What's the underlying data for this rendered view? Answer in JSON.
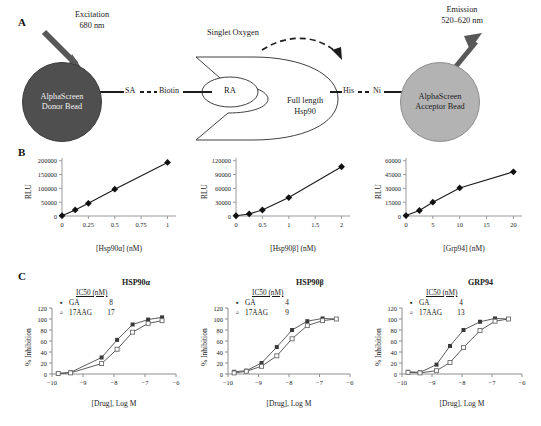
{
  "panels": {
    "a_letter": "A",
    "b_letter": "B",
    "c_letter": "C"
  },
  "diagram": {
    "excitation_label": "Excitation\n680 nm",
    "excitation_line1": "Excitation",
    "excitation_line2": "680 nm",
    "emission_line1": "Emission",
    "emission_line2": "520–620 nm",
    "singlet_oxygen": "Singlet Oxygen",
    "donor_line1": "AlphaScreen",
    "donor_line2": "Donor Bead",
    "acceptor_line1": "AlphaScreen",
    "acceptor_line2": "Acceptor Bead",
    "sa": "SA",
    "biotin": "Biotin",
    "his": "His",
    "ni": "Ni",
    "ra": "RA",
    "hsp90_line1": "Full length",
    "hsp90_line2": "Hsp90",
    "donor_color": "#4f4f4f",
    "acceptor_color": "#b3b3b3",
    "arrow_color": "#555555"
  },
  "chart_data": [
    {
      "id": "b1",
      "type": "line",
      "title": "",
      "xlabel": "[Hsp90α] (nM)",
      "ylabel": "RLU",
      "x": [
        0,
        0.125,
        0.25,
        0.5,
        1
      ],
      "values": [
        1000,
        22000,
        46000,
        97000,
        194000
      ],
      "xticks": [
        0,
        0.25,
        0.5,
        0.75,
        1
      ],
      "xticklabels": [
        "0",
        "0.25",
        "0.5",
        "0.75",
        "1"
      ],
      "yticks": [
        0,
        50000,
        100000,
        150000,
        200000
      ],
      "yticklabels": [
        "0",
        "50000",
        "100000",
        "150000",
        "200000"
      ],
      "xlim": [
        0,
        1.08
      ],
      "ylim": [
        0,
        210000
      ],
      "grid": false,
      "marker": "diamond"
    },
    {
      "id": "b2",
      "type": "line",
      "title": "",
      "xlabel": "[Hsp90β] (nM)",
      "ylabel": "RLU",
      "x": [
        0,
        0.25,
        0.5,
        1,
        2
      ],
      "values": [
        500,
        4500,
        13000,
        40000,
        107000
      ],
      "xticks": [
        0,
        0.5,
        1,
        1.5,
        2
      ],
      "xticklabels": [
        "0",
        "0.5",
        "1",
        "1.5",
        "2"
      ],
      "yticks": [
        0,
        30000,
        60000,
        90000,
        120000
      ],
      "yticklabels": [
        "0",
        "30000",
        "60000",
        "90000",
        "120000"
      ],
      "xlim": [
        0,
        2.16
      ],
      "ylim": [
        0,
        126000
      ],
      "grid": false,
      "marker": "diamond"
    },
    {
      "id": "b3",
      "type": "line",
      "title": "",
      "xlabel": "[Grp94] (nM)",
      "ylabel": "RLU",
      "x": [
        0,
        2.5,
        5,
        10,
        20
      ],
      "values": [
        500,
        6000,
        15000,
        30500,
        48000
      ],
      "xticks": [
        0,
        5,
        10,
        15,
        20
      ],
      "xticklabels": [
        "0",
        "5",
        "10",
        "15",
        "20"
      ],
      "yticks": [
        0,
        15000,
        30000,
        45000,
        60000
      ],
      "yticklabels": [
        "0",
        "15000",
        "30000",
        "45000",
        "60000"
      ],
      "xlim": [
        0,
        21.6
      ],
      "ylim": [
        0,
        63000
      ],
      "grid": false,
      "marker": "diamond"
    },
    {
      "id": "c1",
      "type": "line",
      "title": "HSP90α",
      "xlabel": "[Drug], Log M",
      "ylabel": "% Inhibition",
      "xticks": [
        -10,
        -9,
        -8,
        -7,
        -6
      ],
      "xticklabels": [
        "−10",
        "−9",
        "−8",
        "−7",
        "−6"
      ],
      "yticks": [
        0,
        20,
        40,
        60,
        80,
        100,
        120
      ],
      "yticklabels": [
        "0",
        "20",
        "40",
        "60",
        "80",
        "100",
        "120"
      ],
      "xlim": [
        -10,
        -6
      ],
      "ylim": [
        0,
        120
      ],
      "grid": false,
      "legend_title": "IC50 (nM)",
      "series": [
        {
          "name": "GA",
          "ic50": "8",
          "marker": "filled-square",
          "x": [
            -9.8,
            -9.4,
            -8.4,
            -7.9,
            -7.4,
            -6.9,
            -6.45
          ],
          "values": [
            1,
            3,
            30,
            62,
            90,
            99,
            103
          ]
        },
        {
          "name": "17AAG",
          "ic50": "17",
          "marker": "open-square",
          "x": [
            -9.8,
            -9.4,
            -8.4,
            -7.9,
            -7.4,
            -6.9,
            -6.45
          ],
          "values": [
            1,
            2,
            19,
            45,
            76,
            92,
            97
          ]
        }
      ]
    },
    {
      "id": "c2",
      "type": "line",
      "title": "HSP90β",
      "xlabel": "[Drug], Log M",
      "ylabel": "% Inhibition",
      "xticks": [
        -10,
        -9,
        -8,
        -7,
        -6
      ],
      "xticklabels": [
        "−10",
        "−9",
        "−8",
        "−7",
        "−6"
      ],
      "yticks": [
        0,
        20,
        40,
        60,
        80,
        100,
        120
      ],
      "yticklabels": [
        "0",
        "20",
        "40",
        "60",
        "80",
        "100",
        "120"
      ],
      "xlim": [
        -10,
        -6
      ],
      "ylim": [
        0,
        120
      ],
      "grid": false,
      "legend_title": "IC50 (nM)",
      "series": [
        {
          "name": "GA",
          "ic50": "4",
          "marker": "filled-square",
          "x": [
            -9.8,
            -9.4,
            -8.9,
            -8.4,
            -7.9,
            -7.4,
            -6.9,
            -6.45
          ],
          "values": [
            4,
            6,
            20,
            49,
            80,
            96,
            101,
            100
          ]
        },
        {
          "name": "17AAG",
          "ic50": "9",
          "marker": "open-square",
          "x": [
            -9.8,
            -9.4,
            -8.9,
            -8.4,
            -7.9,
            -7.4,
            -6.9,
            -6.45
          ],
          "values": [
            2,
            5,
            14,
            33,
            64,
            88,
            97,
            100
          ]
        }
      ]
    },
    {
      "id": "c3",
      "type": "line",
      "title": "GRP94",
      "xlabel": "[Drug], Log M",
      "ylabel": "% Inhibition",
      "xticks": [
        -10,
        -9,
        -8,
        -7,
        -6
      ],
      "xticklabels": [
        "−10",
        "−9",
        "−8",
        "−7",
        "−6"
      ],
      "yticks": [
        0,
        20,
        40,
        60,
        80,
        100,
        120
      ],
      "yticklabels": [
        "0",
        "20",
        "40",
        "60",
        "80",
        "100",
        "120"
      ],
      "xlim": [
        -10,
        -6
      ],
      "ylim": [
        0,
        120
      ],
      "grid": false,
      "legend_title": "IC50 (nM)",
      "series": [
        {
          "name": "GA",
          "ic50": "4",
          "marker": "filled-square",
          "x": [
            -9.8,
            -9.4,
            -8.85,
            -8.4,
            -7.95,
            -7.4,
            -6.9,
            -6.45
          ],
          "values": [
            4,
            3,
            17,
            51,
            80,
            95,
            101,
            100
          ]
        },
        {
          "name": "17AAG",
          "ic50": "13",
          "marker": "open-square",
          "x": [
            -9.8,
            -9.4,
            -8.85,
            -8.4,
            -7.95,
            -7.4,
            -6.9,
            -6.45
          ],
          "values": [
            3,
            2,
            6,
            21,
            48,
            79,
            96,
            100
          ]
        }
      ]
    }
  ]
}
